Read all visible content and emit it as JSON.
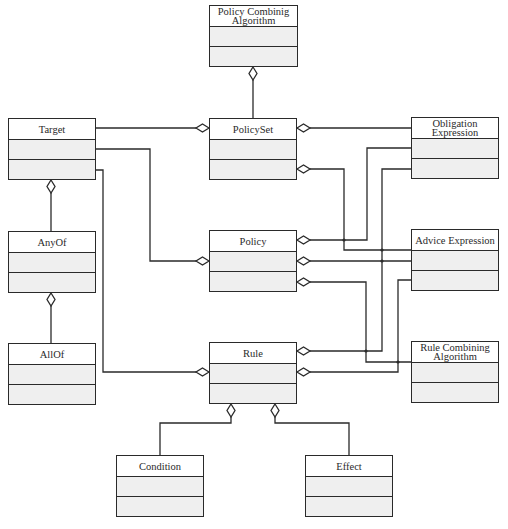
{
  "diagram": {
    "type": "uml-class-diagram",
    "colors": {
      "line": "#2a2a2a",
      "name_fill": "#ffffff",
      "compartment_fill": "#efefef"
    },
    "classes": [
      {
        "id": "pca",
        "name": "Policy Combinig Algorithm",
        "x": 209,
        "y": 5,
        "w": 89,
        "h": 62
      },
      {
        "id": "target",
        "name": "Target",
        "x": 8,
        "y": 118,
        "w": 88,
        "h": 62
      },
      {
        "id": "policyset",
        "name": "PolicySet",
        "x": 209,
        "y": 118,
        "w": 88,
        "h": 62
      },
      {
        "id": "obligation",
        "name": "Obligation Expression",
        "x": 411,
        "y": 117,
        "w": 88,
        "h": 62
      },
      {
        "id": "anyof",
        "name": "AnyOf",
        "x": 8,
        "y": 231,
        "w": 88,
        "h": 62
      },
      {
        "id": "policy",
        "name": "Policy",
        "x": 209,
        "y": 230,
        "w": 88,
        "h": 62
      },
      {
        "id": "advice",
        "name": "Advice Expression",
        "x": 411,
        "y": 229,
        "w": 88,
        "h": 62
      },
      {
        "id": "allof",
        "name": "AllOf",
        "x": 8,
        "y": 343,
        "w": 88,
        "h": 62
      },
      {
        "id": "rule",
        "name": "Rule",
        "x": 209,
        "y": 342,
        "w": 88,
        "h": 62
      },
      {
        "id": "rca",
        "name": "Rule Combining Algorithm",
        "x": 411,
        "y": 341,
        "w": 88,
        "h": 62
      },
      {
        "id": "condition",
        "name": "Condition",
        "x": 116,
        "y": 455,
        "w": 88,
        "h": 62
      },
      {
        "id": "effect",
        "name": "Effect",
        "x": 305,
        "y": 455,
        "w": 88,
        "h": 62
      }
    ],
    "associations": [
      {
        "whole": "PolicySet",
        "part": "Policy Combinig Algorithm",
        "kind": "aggregation"
      },
      {
        "whole": "PolicySet",
        "part": "Target",
        "kind": "aggregation"
      },
      {
        "whole": "PolicySet",
        "part": "Obligation Expression",
        "kind": "aggregation"
      },
      {
        "whole": "PolicySet",
        "part": "Advice Expression",
        "kind": "aggregation"
      },
      {
        "whole": "Policy",
        "part": "Target",
        "kind": "aggregation"
      },
      {
        "whole": "Policy",
        "part": "Obligation Expression",
        "kind": "aggregation"
      },
      {
        "whole": "Policy",
        "part": "Advice Expression",
        "kind": "aggregation"
      },
      {
        "whole": "Policy",
        "part": "Rule Combining Algorithm",
        "kind": "aggregation"
      },
      {
        "whole": "Rule",
        "part": "Target",
        "kind": "aggregation"
      },
      {
        "whole": "Rule",
        "part": "Obligation Expression",
        "kind": "aggregation"
      },
      {
        "whole": "Rule",
        "part": "Advice Expression",
        "kind": "aggregation"
      },
      {
        "whole": "Rule",
        "part": "Condition",
        "kind": "aggregation"
      },
      {
        "whole": "Rule",
        "part": "Effect",
        "kind": "aggregation"
      },
      {
        "whole": "Target",
        "part": "AnyOf",
        "kind": "aggregation"
      },
      {
        "whole": "AnyOf",
        "part": "AllOf",
        "kind": "aggregation"
      }
    ]
  }
}
